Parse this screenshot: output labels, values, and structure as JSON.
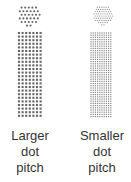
{
  "panels": [
    {
      "id": "larger",
      "label_lines": [
        "Larger",
        "dot",
        "pitch"
      ],
      "pitch": 3.6,
      "dot_radius": 1.05,
      "dot_color": "#666666",
      "circle": {
        "cx": 29,
        "cy": 15,
        "r": 11
      },
      "column": {
        "x": 19,
        "y": 33,
        "w": 22,
        "h": 84
      }
    },
    {
      "id": "smaller",
      "label_lines": [
        "Smaller",
        "dot",
        "pitch"
      ],
      "pitch": 2.2,
      "dot_radius": 0.6,
      "dot_color": "#888888",
      "circle": {
        "cx": 103,
        "cy": 15,
        "r": 10
      },
      "column": {
        "x": 91,
        "y": 33,
        "w": 22,
        "h": 84
      }
    }
  ]
}
